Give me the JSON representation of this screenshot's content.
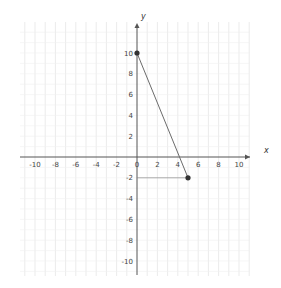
{
  "chart_data": {
    "type": "line",
    "title": "",
    "xlabel": "x",
    "ylabel": "y",
    "xlim": [
      -11,
      11
    ],
    "ylim": [
      -11,
      12
    ],
    "grid": true,
    "x_ticks": [
      -10,
      -8,
      -6,
      -4,
      -2,
      0,
      2,
      4,
      6,
      8,
      10
    ],
    "x_tick_labels": [
      "-10",
      "-8",
      "-6",
      "-4",
      "-2",
      "0",
      "2",
      "4",
      "6",
      "8",
      "10"
    ],
    "y_ticks": [
      10,
      8,
      6,
      4,
      2,
      -2,
      -4,
      -6,
      -8,
      -10
    ],
    "y_tick_labels": [
      "10",
      "8",
      "6",
      "4",
      "2",
      "-2",
      "-4",
      "-6",
      "-8",
      "-10"
    ],
    "series": [
      {
        "name": "segment",
        "points": [
          {
            "x": 0,
            "y": 10
          },
          {
            "x": 5,
            "y": -2
          }
        ],
        "color": "#6b6b6b",
        "markers": true
      }
    ],
    "annotations": [
      {
        "type": "guide-line",
        "from": {
          "x": 0,
          "y": -2
        },
        "to": {
          "x": 5,
          "y": -2
        }
      }
    ],
    "legend": null
  },
  "labels": {
    "x_axis": "x",
    "y_axis": "y"
  },
  "colors": {
    "axis": "#555555",
    "grid": "#e6e6e6",
    "segment": "#6b6b6b",
    "point": "#333333",
    "guide": "#888888"
  }
}
